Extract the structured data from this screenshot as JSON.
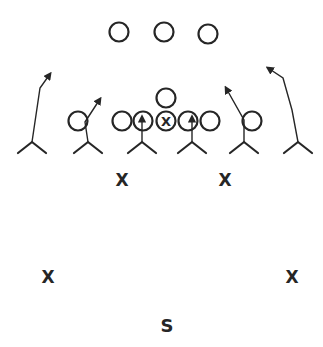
{
  "diagram": {
    "type": "football-play",
    "colors": {
      "ink": "#262626",
      "background": "#ffffff"
    },
    "offense": {
      "symbol": "circle",
      "backfield": [
        {
          "id": "back-left",
          "cx": 119,
          "cy": 32
        },
        {
          "id": "back-middle",
          "cx": 164,
          "cy": 32
        },
        {
          "id": "back-right",
          "cx": 208,
          "cy": 34
        }
      ],
      "quarterback": {
        "id": "qb",
        "cx": 166,
        "cy": 98
      },
      "line": [
        {
          "id": "left-tackle",
          "cx": 122,
          "cy": 121
        },
        {
          "id": "left-guard",
          "cx": 143,
          "cy": 121
        },
        {
          "id": "center",
          "cx": 166,
          "cy": 121,
          "marked": true,
          "mark": "X"
        },
        {
          "id": "right-guard",
          "cx": 188,
          "cy": 121
        },
        {
          "id": "right-tackle",
          "cx": 210,
          "cy": 121
        }
      ],
      "ends": [
        {
          "id": "left-wing",
          "cx": 78,
          "cy": 121
        },
        {
          "id": "right-wing",
          "cx": 252,
          "cy": 121
        }
      ]
    },
    "defense": {
      "rushers": [
        {
          "id": "rusher-far-left",
          "x": 32,
          "y": 142,
          "route": "M32,142 L40,88 L50,74"
        },
        {
          "id": "rusher-left",
          "x": 88,
          "y": 142,
          "route": "M88,142 L85,122 L100,99"
        },
        {
          "id": "rusher-left-inside",
          "x": 142,
          "y": 142,
          "route": "M142,142 L142,117"
        },
        {
          "id": "rusher-right-inside",
          "x": 192,
          "y": 142,
          "route": "M192,142 L192,117"
        },
        {
          "id": "rusher-right",
          "x": 244,
          "y": 142,
          "route": "M244,142 L244,120 L226,88"
        },
        {
          "id": "rusher-far-right",
          "x": 298,
          "y": 142,
          "route": "M298,142 L292,110 L283,78 L268,68"
        }
      ],
      "linebackers": [
        {
          "id": "lb-left",
          "label": "X",
          "x": 122,
          "y": 180
        },
        {
          "id": "lb-right",
          "label": "X",
          "x": 225,
          "y": 180
        }
      ],
      "corners": [
        {
          "id": "cb-left",
          "label": "X",
          "x": 48,
          "y": 277
        },
        {
          "id": "cb-right",
          "label": "X",
          "x": 292,
          "y": 277
        }
      ],
      "safety": {
        "id": "safety",
        "label": "S",
        "x": 167,
        "y": 326
      }
    }
  }
}
